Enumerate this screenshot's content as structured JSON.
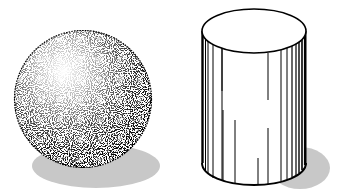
{
  "scene": {
    "description": "Black-and-white illustration of a stippled sphere and a line-shaded cylinder with grey cast shadows",
    "background": "#ffffff",
    "colors": {
      "ink": "#000000",
      "shadow": "#c8c8c8",
      "fill": "#ffffff"
    },
    "objects": [
      {
        "name": "sphere",
        "shading": "stipple",
        "cx": 83,
        "cy": 99,
        "r": 69,
        "highlight": {
          "cx": 62,
          "cy": 68
        },
        "shadow": {
          "cx": 96,
          "cy": 166,
          "rx": 64,
          "ry": 22
        }
      },
      {
        "name": "cylinder",
        "shading": "vertical-lines",
        "left": 202,
        "right": 306,
        "top_cy": 31,
        "top_ry": 22,
        "bottom_cy": 163,
        "bottom_ry": 22,
        "shadow": {
          "cx": 300,
          "cy": 168,
          "rx": 30,
          "ry": 21
        }
      }
    ]
  }
}
